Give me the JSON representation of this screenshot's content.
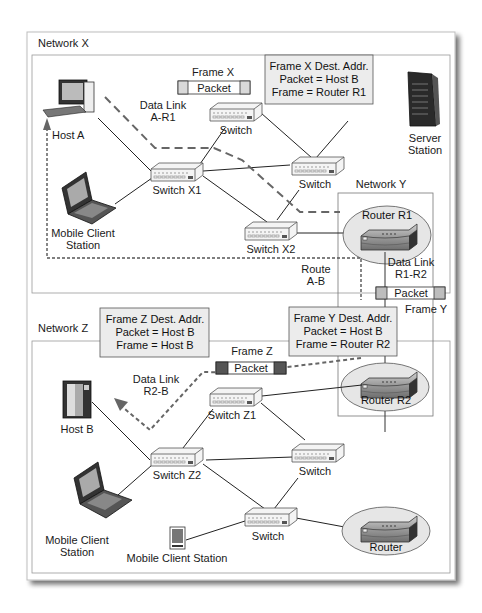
{
  "networks": {
    "x": {
      "label": "Network X"
    },
    "y": {
      "label": "Network Y"
    },
    "z": {
      "label": "Network Z"
    }
  },
  "network_x": {
    "host_a": {
      "label": "Host A"
    },
    "mobile_client": {
      "label_line1": "Mobile Client",
      "label_line2": "Station"
    },
    "server": {
      "label_line1": "Server",
      "label_line2": "Station"
    },
    "switch_x1": {
      "label": "Switch X1"
    },
    "switch_x2": {
      "label": "Switch X2"
    },
    "switch_top": {
      "label": "Switch"
    },
    "switch_mid": {
      "label": "Switch"
    },
    "data_link": {
      "line1": "Data Link",
      "line2": "A-R1"
    },
    "frame": {
      "title": "Frame X",
      "packet": "Packet"
    },
    "dest_box": {
      "line1": "Frame X Dest. Addr.",
      "line2": "Packet = Host B",
      "line3": "Frame = Router R1"
    },
    "route": {
      "line1": "Route",
      "line2": "A-B"
    }
  },
  "network_y": {
    "router_r1": {
      "label": "Router R1"
    },
    "router_r2": {
      "label": "Router R2"
    },
    "data_link": {
      "line1": "Data Link",
      "line2": "R1-R2"
    },
    "frame": {
      "title": "Frame Y",
      "packet": "Packet"
    },
    "dest_box": {
      "line1": "Frame Y Dest. Addr.",
      "line2": "Packet  = Host B",
      "line3": "Frame = Router R2"
    }
  },
  "network_z": {
    "host_b": {
      "label": "Host B"
    },
    "mobile_client": {
      "label_line1": "Mobile Client",
      "label_line2": "Station"
    },
    "mobile_client_small": {
      "label": "Mobile Client Station"
    },
    "switch_z1": {
      "label": "Switch Z1"
    },
    "switch_z2": {
      "label": "Switch Z2"
    },
    "switch_right": {
      "label": "Switch"
    },
    "switch_bottom": {
      "label": "Switch"
    },
    "router": {
      "label": "Router"
    },
    "data_link": {
      "line1": "Data Link",
      "line2": "R2-B"
    },
    "frame": {
      "title": "Frame Z",
      "packet": "Packet"
    },
    "dest_box": {
      "line1": "Frame Z Dest. Addr.",
      "line2": "Packet  = Host B",
      "line3": "Frame = Host B"
    }
  },
  "colors": {
    "frame_x_header": "#d9d9d9",
    "frame_y_header": "#bdbdbd",
    "frame_z_header": "#555555",
    "dest_box_fill": "#ececec",
    "router_ellipse": "#e6e6e6",
    "dashed_route": "#555555"
  }
}
